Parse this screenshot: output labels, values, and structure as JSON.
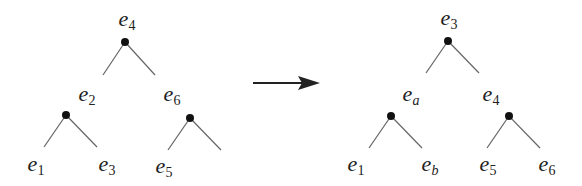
{
  "diagram": {
    "type": "tree-rotation",
    "left_tree": {
      "root": "4",
      "level1": [
        "2",
        "6"
      ],
      "leaves": [
        "1",
        "3",
        "5"
      ]
    },
    "right_tree": {
      "root": "3",
      "level1": [
        "a",
        "4"
      ],
      "leaves": [
        "1",
        "b",
        "5",
        "6"
      ]
    },
    "labels": {
      "L_root": "4",
      "L_left": "2",
      "L_right": "6",
      "L_leaf1": "1",
      "L_leaf2": "3",
      "L_leaf3": "5",
      "R_root": "3",
      "R_left": "a",
      "R_right": "4",
      "R_leaf1": "1",
      "R_leaf2": "b",
      "R_leaf3": "5",
      "R_leaf4": "6"
    },
    "base_symbol": "e",
    "colors": {
      "line": "#555555",
      "node": "#111111",
      "text": "#222222"
    }
  }
}
